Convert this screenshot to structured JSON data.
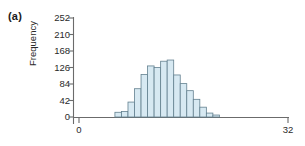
{
  "panel": {
    "label": "(a)"
  },
  "axes": {
    "ylabel": "Frequency",
    "xlabel": ""
  },
  "chart_data": {
    "type": "bar",
    "title": "",
    "subtitle": "",
    "xlabel": "",
    "ylabel": "Frequency",
    "xlim": [
      0,
      32
    ],
    "ylim": [
      0,
      252
    ],
    "xticks": [
      0,
      32
    ],
    "xticklabels": [
      "0",
      "32"
    ],
    "yticks": [
      0,
      42,
      84,
      126,
      168,
      210,
      252
    ],
    "yticklabels": [
      "0",
      "42",
      "84",
      "126",
      "168",
      "210",
      "252"
    ],
    "grid": false,
    "legend": null,
    "bar_fill_color": "#d7e9f2",
    "bar_edge_color": "#63808f",
    "axis_color": "#6b6b6b",
    "bin_width": 1,
    "categories": [
      6,
      7,
      8,
      9,
      10,
      11,
      12,
      13,
      14,
      15,
      16,
      17,
      18,
      19,
      20,
      21
    ],
    "values": [
      12,
      14,
      38,
      72,
      108,
      130,
      126,
      142,
      145,
      107,
      85,
      67,
      45,
      25,
      10,
      5
    ],
    "annotations": []
  }
}
